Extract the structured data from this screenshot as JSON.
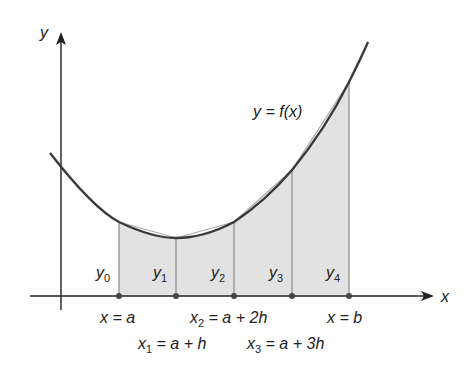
{
  "diagram": {
    "axes": {
      "x_label": "x",
      "y_label": "y"
    },
    "curve_label": "y = f(x)",
    "ordinates": [
      {
        "name": "y",
        "sub": "0"
      },
      {
        "name": "y",
        "sub": "1"
      },
      {
        "name": "y",
        "sub": "2"
      },
      {
        "name": "y",
        "sub": "3"
      },
      {
        "name": "y",
        "sub": "4"
      }
    ],
    "x_labels": {
      "x0": {
        "lhs": "x",
        "sub": "",
        "rhs": " = a"
      },
      "x1": {
        "lhs": "x",
        "sub": "1",
        "rhs": " = a + h"
      },
      "x2": {
        "lhs": "x",
        "sub": "2",
        "rhs": " = a + 2h"
      },
      "x3": {
        "lhs": "x",
        "sub": "3",
        "rhs": " = a + 3h"
      },
      "x4": {
        "lhs": "x",
        "sub": "",
        "rhs": " = b"
      }
    },
    "colors": {
      "curve": "#3a3a3a",
      "fill": "#e2e2e2",
      "strip_lines": "#8a8a8a",
      "axis": "#222222",
      "chord": "#a8a8a8"
    }
  }
}
